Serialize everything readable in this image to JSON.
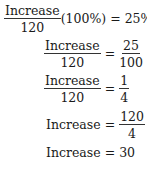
{
  "math": {
    "line1": {
      "numerator": "Increase",
      "denominator": "120",
      "factor": "(100%)",
      "equals": "=",
      "rhs": "25%"
    },
    "line2": {
      "lhs_num": "Increase",
      "lhs_den": "120",
      "equals": "=",
      "rhs_num": "25",
      "rhs_den": "100"
    },
    "line3": {
      "lhs_num": "Increase",
      "lhs_den": "120",
      "equals": "=",
      "rhs_num": "1",
      "rhs_den": "4"
    },
    "line4": {
      "lhs": "Increase",
      "equals": "=",
      "rhs_num": "120",
      "rhs_den": "4"
    },
    "line5": {
      "lhs": "Increase",
      "equals": "=",
      "rhs": "30"
    }
  }
}
